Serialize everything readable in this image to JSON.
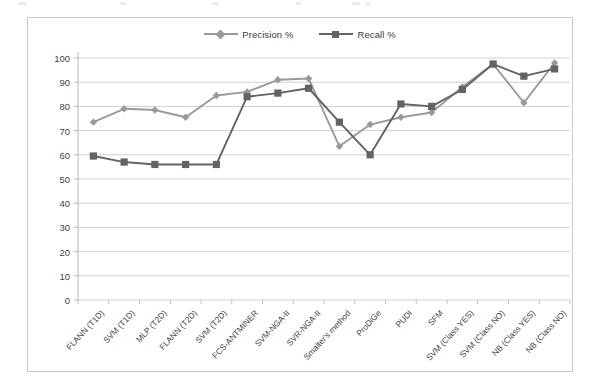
{
  "chart_data": {
    "type": "line",
    "title": "",
    "subtitle": "",
    "xlabel": "",
    "ylabel": "",
    "ylim": [
      0,
      100
    ],
    "yticks": [
      0,
      10,
      20,
      30,
      40,
      50,
      60,
      70,
      80,
      90,
      100
    ],
    "grid": true,
    "legend_position": "top-center",
    "categories": [
      "FLANN (T1D)",
      "SVM (T1D)",
      "MLP (T2D)",
      "FLANN (T2D)",
      "SVM (T2D)",
      "FCS-ANTMINER",
      "SVM-NGA-II",
      "SVR-NGA-II",
      "Smalter's method",
      "ProDiGe",
      "PUDI",
      "SFM",
      "SVM (Class YES)",
      "SVM (Class NO)",
      "NB (Class YES)",
      "NB (Class NO)"
    ],
    "series": [
      {
        "name": "Precision %",
        "marker": "diamond",
        "color": "#9a9a9a",
        "values": [
          73.5,
          79,
          78.5,
          75.5,
          84.5,
          86,
          91,
          91.5,
          63.5,
          72.5,
          75.5,
          77.5,
          88,
          97.5,
          81.5,
          98
        ]
      },
      {
        "name": "Recall %",
        "marker": "square",
        "color": "#636363",
        "values": [
          59.5,
          57,
          56,
          56,
          56,
          84,
          85.5,
          87.5,
          73.5,
          60,
          81,
          80,
          87,
          97.5,
          92.5,
          95.5
        ]
      }
    ]
  },
  "legend": {
    "entries": [
      {
        "label": "Precision %"
      },
      {
        "label": "Recall %"
      }
    ]
  },
  "colors": {
    "precision": "#9a9a9a",
    "recall": "#636363",
    "grid": "#c4c4c4",
    "axis": "#b0b0b0",
    "frame": "#c9c9c9",
    "text": "#3f3f3f"
  }
}
